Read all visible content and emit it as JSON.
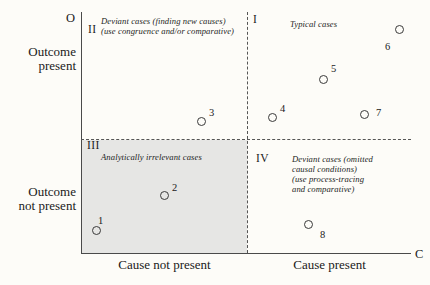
{
  "figure": {
    "axes": {
      "y_letter": "O",
      "x_letter": "C",
      "y_top_label": "Outcome\npresent",
      "y_bottom_label": "Outcome\nnot present",
      "x_left_label": "Cause not present",
      "x_right_label": "Cause present"
    },
    "quadrants": [
      {
        "numeral": "II",
        "caption": "Deviant cases (finding new causes)\n(use congruence and/or comparative)",
        "shaded": false
      },
      {
        "numeral": "I",
        "caption": "Typical cases",
        "shaded": false
      },
      {
        "numeral": "III",
        "caption": "Analytically irrelevant cases",
        "shaded": true
      },
      {
        "numeral": "IV",
        "caption": "Deviant cases (omitted\ncausal conditions)\n(use process-tracing\nand comparative)",
        "shaded": false
      }
    ],
    "colors": {
      "background": "#fdfcf8",
      "axis": "#4a4a4a",
      "divider": "#555555",
      "shade": "#e6e6e4",
      "text": "#1a1a1a"
    }
  },
  "chart_data": {
    "type": "scatter",
    "title": "",
    "xlabel": "Cause",
    "ylabel": "Outcome",
    "xlim": [
      0,
      1
    ],
    "ylim": [
      0,
      1
    ],
    "grid": false,
    "legend": "none",
    "x_tick_labels": [
      "Cause not present",
      "Cause present"
    ],
    "y_tick_labels": [
      "Outcome present",
      "Outcome not present"
    ],
    "x_axis_end_label": "C",
    "y_axis_end_label": "O",
    "quadrant_divider_x": 0.5,
    "quadrant_divider_y": 0.5,
    "annotations": [
      {
        "quadrant": "II",
        "text": "Deviant cases (finding new causes) (use congruence and/or comparative)"
      },
      {
        "quadrant": "I",
        "text": "Typical cases"
      },
      {
        "quadrant": "III",
        "text": "Analytically irrelevant cases"
      },
      {
        "quadrant": "IV",
        "text": "Deviant cases (omitted causal conditions) (use process-tracing and comparative)"
      }
    ],
    "points": [
      {
        "label": "1",
        "x": 0.045,
        "y": 0.096,
        "quadrant": "III",
        "px": 96,
        "py": 230,
        "lx": 98,
        "ly": 215
      },
      {
        "label": "2",
        "x": 0.222,
        "y": 0.285,
        "quadrant": "III",
        "px": 164,
        "py": 195,
        "lx": 172,
        "ly": 182
      },
      {
        "label": "3",
        "x": 0.36,
        "y": 0.55,
        "quadrant": "II",
        "px": 201,
        "py": 121,
        "lx": 209,
        "ly": 107
      },
      {
        "label": "4",
        "x": 0.56,
        "y": 0.565,
        "quadrant": "I",
        "px": 272,
        "py": 117,
        "lx": 280,
        "ly": 103
      },
      {
        "label": "5",
        "x": 0.715,
        "y": 0.72,
        "quadrant": "I",
        "px": 323,
        "py": 79,
        "lx": 331,
        "ly": 63
      },
      {
        "label": "6",
        "x": 0.93,
        "y": 0.92,
        "quadrant": "I",
        "px": 399,
        "py": 29,
        "lx": 385,
        "ly": 41
      },
      {
        "label": "7",
        "x": 0.845,
        "y": 0.572,
        "quadrant": "I",
        "px": 364,
        "py": 114,
        "lx": 376,
        "ly": 107
      },
      {
        "label": "8",
        "x": 0.675,
        "y": 0.11,
        "quadrant": "IV",
        "px": 308,
        "py": 224,
        "lx": 320,
        "ly": 229
      }
    ]
  }
}
